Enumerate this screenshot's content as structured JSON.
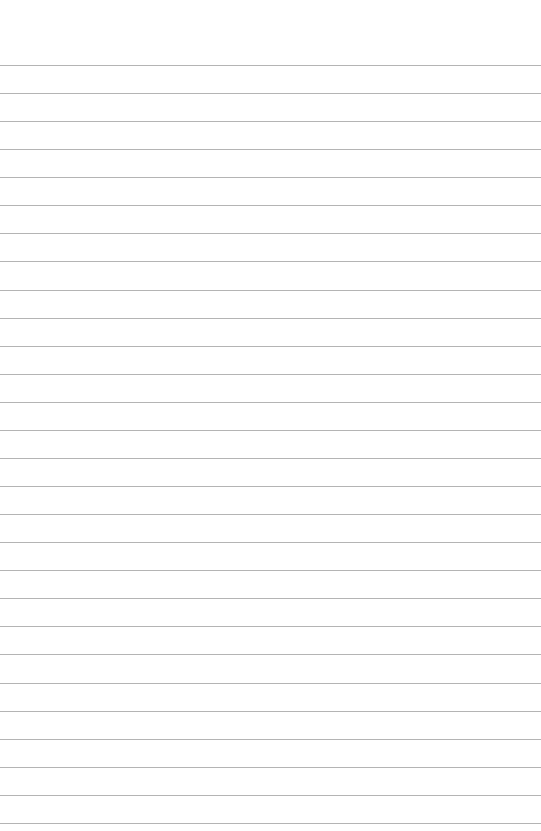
{
  "page": {
    "type": "lined-paper",
    "background_color": "#ffffff",
    "line_color": "#b4b4b4",
    "line_count": 28,
    "first_line_y": 65,
    "line_spacing": 28.07
  }
}
